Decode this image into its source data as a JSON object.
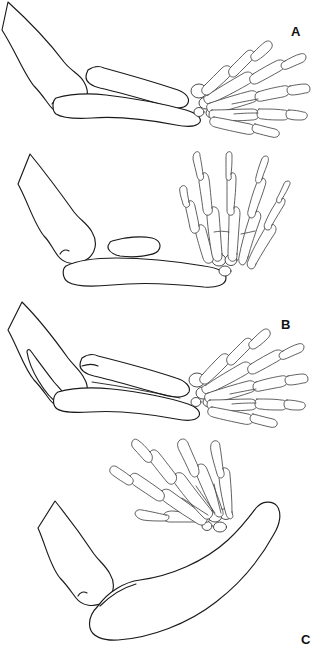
{
  "figure": {
    "background_color": "#ffffff",
    "line_color": "#1a1a1a",
    "label_color": "#111111",
    "width": 322,
    "height": 654,
    "panel_count": 4
  },
  "panels": [
    {
      "id": "a",
      "label": "A",
      "label_x": 295,
      "label_y": 32,
      "description": "Normal elbow with humerus, radius and ulna, hand held in neutral alignment",
      "bones": [
        {
          "name": "humerus",
          "count": 1
        },
        {
          "name": "radius",
          "count": 1
        },
        {
          "name": "ulna",
          "count": 1
        },
        {
          "name": "carpals",
          "count": 4
        },
        {
          "name": "metacarpals",
          "count": 5
        },
        {
          "name": "phalanges",
          "count": 14
        }
      ],
      "hand_orientation": "horizontal-right",
      "digit_count": 5
    },
    {
      "id": "b",
      "label": "B",
      "label_x": 286,
      "label_y": 177,
      "description": "Short detached radius remnant with bowed ulna, hand deviated radially and held upright",
      "bones": [
        {
          "name": "humerus",
          "count": 1
        },
        {
          "name": "radius-remnant",
          "count": 1
        },
        {
          "name": "ulna",
          "count": 1
        },
        {
          "name": "carpals",
          "count": 3
        },
        {
          "name": "metacarpals",
          "count": 5
        },
        {
          "name": "phalanges",
          "count": 14
        }
      ],
      "hand_orientation": "vertical-up",
      "digit_count": 5
    },
    {
      "id": "c",
      "label": "C",
      "label_x": 306,
      "label_y": 340,
      "description": "Elongated pointed olecranon with slender paired forearm bones, hand fanned to the right",
      "bones": [
        {
          "name": "humerus",
          "count": 1
        },
        {
          "name": "radius",
          "count": 1
        },
        {
          "name": "ulna",
          "count": 1
        },
        {
          "name": "carpals",
          "count": 4
        },
        {
          "name": "metacarpals",
          "count": 5
        },
        {
          "name": "phalanges",
          "count": 14
        }
      ],
      "hand_orientation": "horizontal-right",
      "digit_count": 5
    },
    {
      "id": "d",
      "label": "D",
      "label_x": 224,
      "label_y": 471,
      "description": "Severely curved single fused forearm bone with hand displaced proximally and angled upward",
      "bones": [
        {
          "name": "humerus",
          "count": 1
        },
        {
          "name": "fused-curved-forearm-bone",
          "count": 1
        },
        {
          "name": "carpals",
          "count": 4
        },
        {
          "name": "metacarpals",
          "count": 5
        },
        {
          "name": "phalanges",
          "count": 14
        }
      ],
      "hand_orientation": "diagonal-up-left",
      "digit_count": 5
    }
  ]
}
